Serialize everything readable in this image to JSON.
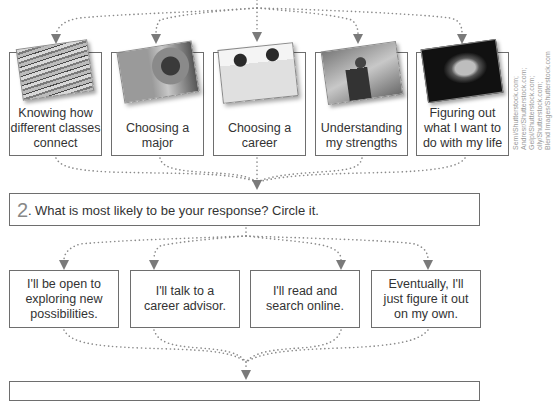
{
  "top_options": [
    {
      "label": "Knowing how different classes connect",
      "image": "stack-of-books-photo"
    },
    {
      "label": "Choosing a major",
      "image": "student-with-course-list-photo"
    },
    {
      "label": "Choosing a career",
      "image": "professionals-photo"
    },
    {
      "label": "Understanding my strengths",
      "image": "superhero-businessman-photo"
    },
    {
      "label": "Figuring out what I want to do with my life",
      "image": "thinking-man-photo"
    }
  ],
  "question": {
    "number": "2",
    "number_suffix": ".",
    "text": "What is most likely to be your response? Circle it."
  },
  "responses": [
    {
      "label": "I'll be open to exploring new possibilities."
    },
    {
      "label": "I'll talk to a career advisor."
    },
    {
      "label": "I'll read and search online."
    },
    {
      "label": "Eventually, I'll just figure it out on my own."
    }
  ],
  "credits": [
    "Semi/Shutterstock.com;",
    "Andresr/Shutterstock.com;",
    "Gelpi/Shutterstock.com;",
    "olly/Shutterstock.com;",
    "Blend Images/Shutterstock.com"
  ],
  "colors": {
    "border": "#6e6e6e",
    "connector": "#8a8a8a",
    "text": "#333333",
    "number": "#888888"
  }
}
